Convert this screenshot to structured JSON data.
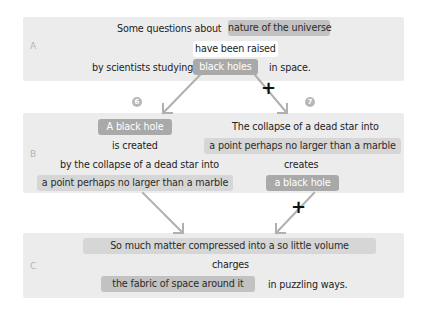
{
  "panels": {
    "a": {
      "label": "A",
      "line1_prefix": "Some questions about",
      "line1_highlight": "nature of the universe",
      "line2": "have been raised",
      "line3_prefix": "by scientists studying",
      "line3_highlight": "black holes",
      "line3_suffix": "in space."
    },
    "b": {
      "label": "B",
      "left": {
        "subject": "A black hole",
        "verb": "is created",
        "phrase": "by the collapse of a dead star into",
        "phrase_highlight": "a point perhaps no larger than a marble"
      },
      "right": {
        "subject_line1": "The collapse of a dead star into",
        "subject_line2": "a point perhaps no larger than a marble",
        "verb": "creates",
        "object": "a black hole"
      }
    },
    "c": {
      "label": "C",
      "subject": "So much matter compressed into a so little volume",
      "verb": "charges",
      "object": "the fabric of space around it",
      "suffix": "in puzzling ways."
    }
  },
  "markers": {
    "left_number": "6",
    "right_number": "7",
    "plus_symbol": "+"
  },
  "colors": {
    "panel_bg": "#ececec",
    "arrow": "#b0b0b0",
    "highlight_mid": "#c2c2c2",
    "highlight_dark": "#a9a9a9",
    "plus": "#111111"
  }
}
